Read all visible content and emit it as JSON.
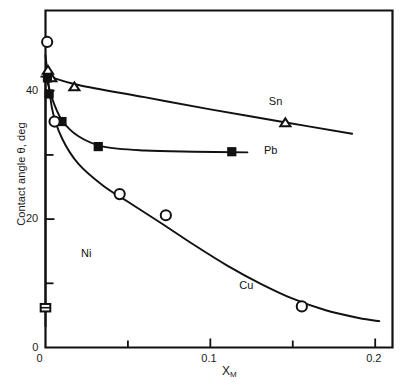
{
  "chart_data": {
    "type": "scatter",
    "title": "",
    "xlabel": "X_M",
    "xlabel_base": "X",
    "xlabel_sub": "M",
    "ylabel": "Contact angle θ, deg",
    "xlim": [
      0,
      0.2105
    ],
    "ylim": [
      0,
      52.5
    ],
    "x_ticks_major": [
      0,
      0.1,
      0.2
    ],
    "x_tick_labels": [
      "0",
      "0.1",
      "0.2"
    ],
    "x_ticks_minor": [
      0.05,
      0.15
    ],
    "y_ticks_major": [
      0,
      20,
      40
    ],
    "y_tick_labels": [
      "0",
      "20",
      "40"
    ],
    "y_ticks_minor": [
      10,
      30
    ],
    "grid": false,
    "legend_position": "inline-annotations",
    "series": [
      {
        "name": "Sn",
        "marker": "open-triangle",
        "label": "Sn",
        "label_x": 0.1355,
        "label_y": 38.2,
        "points": [
          {
            "x": 0.0015,
            "y": 43.2
          },
          {
            "x": 0.0035,
            "y": 42.0
          },
          {
            "x": 0.0175,
            "y": 40.6
          },
          {
            "x": 0.1455,
            "y": 35.0
          }
        ],
        "curve": [
          {
            "x": 0.0,
            "y": 42.4
          },
          {
            "x": 0.02,
            "y": 40.9
          },
          {
            "x": 0.06,
            "y": 39.0
          },
          {
            "x": 0.1,
            "y": 37.1
          },
          {
            "x": 0.145,
            "y": 35.1
          },
          {
            "x": 0.186,
            "y": 33.3
          }
        ]
      },
      {
        "name": "Pb",
        "marker": "filled-square",
        "label": "Pb",
        "label_x": 0.1325,
        "label_y": 30.6,
        "points": [
          {
            "x": 0.0012,
            "y": 42.0
          },
          {
            "x": 0.0022,
            "y": 39.5
          },
          {
            "x": 0.01,
            "y": 35.2
          },
          {
            "x": 0.032,
            "y": 31.3
          },
          {
            "x": 0.113,
            "y": 30.5
          }
        ],
        "curve": [
          {
            "x": 0.0,
            "y": 42.6
          },
          {
            "x": 0.004,
            "y": 38.8
          },
          {
            "x": 0.01,
            "y": 35.4
          },
          {
            "x": 0.02,
            "y": 32.9
          },
          {
            "x": 0.035,
            "y": 31.3
          },
          {
            "x": 0.06,
            "y": 30.7
          },
          {
            "x": 0.09,
            "y": 30.5
          },
          {
            "x": 0.1225,
            "y": 30.4
          }
        ]
      },
      {
        "name": "Cu",
        "marker": "open-circle",
        "label": "Cu",
        "label_x": 0.1175,
        "label_y": 9.6,
        "points": [
          {
            "x": 0.001,
            "y": 47.6
          },
          {
            "x": 0.0055,
            "y": 35.2
          },
          {
            "x": 0.045,
            "y": 23.9
          },
          {
            "x": 0.073,
            "y": 20.6
          },
          {
            "x": 0.1555,
            "y": 6.4
          }
        ],
        "curve": [
          {
            "x": 0.0,
            "y": 45.5
          },
          {
            "x": 0.004,
            "y": 37.2
          },
          {
            "x": 0.01,
            "y": 32.6
          },
          {
            "x": 0.02,
            "y": 28.6
          },
          {
            "x": 0.035,
            "y": 25.2
          },
          {
            "x": 0.05,
            "y": 22.7
          },
          {
            "x": 0.07,
            "y": 19.4
          },
          {
            "x": 0.09,
            "y": 16.0
          },
          {
            "x": 0.11,
            "y": 12.8
          },
          {
            "x": 0.13,
            "y": 10.0
          },
          {
            "x": 0.15,
            "y": 7.6
          },
          {
            "x": 0.17,
            "y": 5.8
          },
          {
            "x": 0.19,
            "y": 4.6
          },
          {
            "x": 0.2025,
            "y": 4.1
          }
        ]
      },
      {
        "name": "Ni",
        "marker": "open-square-errorbar",
        "label": "Ni",
        "label_x": 0.0215,
        "label_y": 14.6,
        "points": [
          {
            "x": 0.0,
            "y": 6.2,
            "yerr_low": 3.0,
            "yerr_high": 36.0
          }
        ]
      }
    ]
  }
}
